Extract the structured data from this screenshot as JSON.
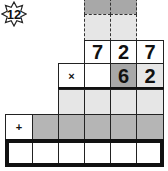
{
  "badge": {
    "label": "12",
    "icon": "eight-point-star-icon"
  },
  "grid": {
    "carry_rows": [
      {
        "cells": [
          "",
          ""
        ],
        "style": "dark"
      },
      {
        "cells": [
          "",
          ""
        ],
        "style": "light"
      }
    ],
    "multiplicand": [
      "7",
      "2",
      "7"
    ],
    "multiplier_row": {
      "operator": "×",
      "digits": [
        "",
        "6",
        "2"
      ]
    },
    "partial_row_1": [
      "",
      "",
      "",
      ""
    ],
    "partial_row_2": {
      "operator": "+",
      "digits": [
        "",
        "",
        "",
        "",
        ""
      ]
    },
    "answer_row": [
      "",
      "",
      "",
      "",
      "",
      ""
    ]
  },
  "colors": {
    "dark_gray": "#a8a8a8",
    "light_gray": "#e6e6e6",
    "border": "#111111"
  }
}
